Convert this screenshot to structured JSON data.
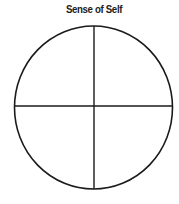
{
  "diagram": {
    "title": "Sense of Self",
    "shape": "circle",
    "quadrants": 4,
    "stroke_color": "#1a1a1a",
    "background_color": "#ffffff"
  }
}
